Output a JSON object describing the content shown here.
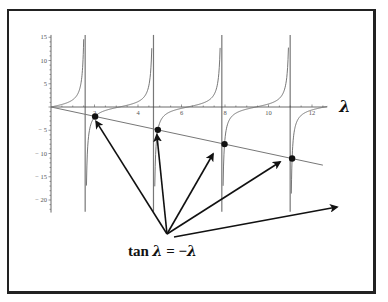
{
  "chart_data": {
    "type": "line",
    "title": "",
    "xlabel": "λ",
    "ylabel": "",
    "xlim": [
      0,
      12.7
    ],
    "ylim": [
      -22.7,
      15.5
    ],
    "x_ticks": [
      2,
      4,
      6,
      8,
      10,
      12
    ],
    "x_tick_labels": [
      "2",
      "4",
      "6",
      "8",
      "10",
      "12"
    ],
    "y_ticks": [
      15,
      10,
      5,
      0,
      -5,
      -10,
      -15,
      -20
    ],
    "y_tick_labels": [
      "15",
      "10",
      "5",
      "",
      "− 5",
      "− 10",
      "− 15",
      "− 20"
    ],
    "grid": false,
    "series": [
      {
        "name": "tan λ",
        "function": "tan(x)",
        "asymptotes": [
          1.571,
          4.712,
          7.854,
          10.996
        ]
      },
      {
        "name": "−λ",
        "function": "-x",
        "x_range": [
          0,
          12.5
        ]
      }
    ],
    "intersection_points": [
      {
        "x": 2.029,
        "y": -2.029
      },
      {
        "x": 4.913,
        "y": -4.913
      },
      {
        "x": 7.979,
        "y": -7.979
      },
      {
        "x": 11.086,
        "y": -11.086
      }
    ],
    "arrow_count": 5,
    "annotation": "tan λ = −λ"
  },
  "equation": {
    "lhs_fn": "tan",
    "lhs_var": "λ",
    "eq": " = −",
    "rhs_var": "λ"
  },
  "axis_label": "λ"
}
